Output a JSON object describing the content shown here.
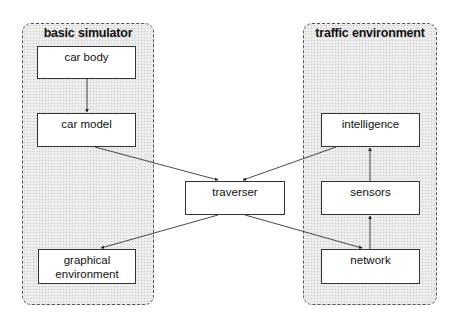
{
  "groups": {
    "basic_simulator": {
      "title": "basic simulator"
    },
    "traffic_environment": {
      "title": "traffic environment"
    }
  },
  "nodes": {
    "car_body": "car body",
    "car_model": "car model",
    "graphical_environment_line1": "graphical",
    "graphical_environment_line2": "environment",
    "traverser": "traverser",
    "intelligence": "intelligence",
    "sensors": "sensors",
    "network": "network"
  },
  "edges": [
    {
      "from": "car body",
      "to": "car model"
    },
    {
      "from": "car model",
      "to": "traverser"
    },
    {
      "from": "intelligence",
      "to": "traverser"
    },
    {
      "from": "traverser",
      "to": "graphical environment"
    },
    {
      "from": "traverser",
      "to": "network"
    },
    {
      "from": "network",
      "to": "sensors"
    },
    {
      "from": "sensors",
      "to": "intelligence"
    }
  ]
}
